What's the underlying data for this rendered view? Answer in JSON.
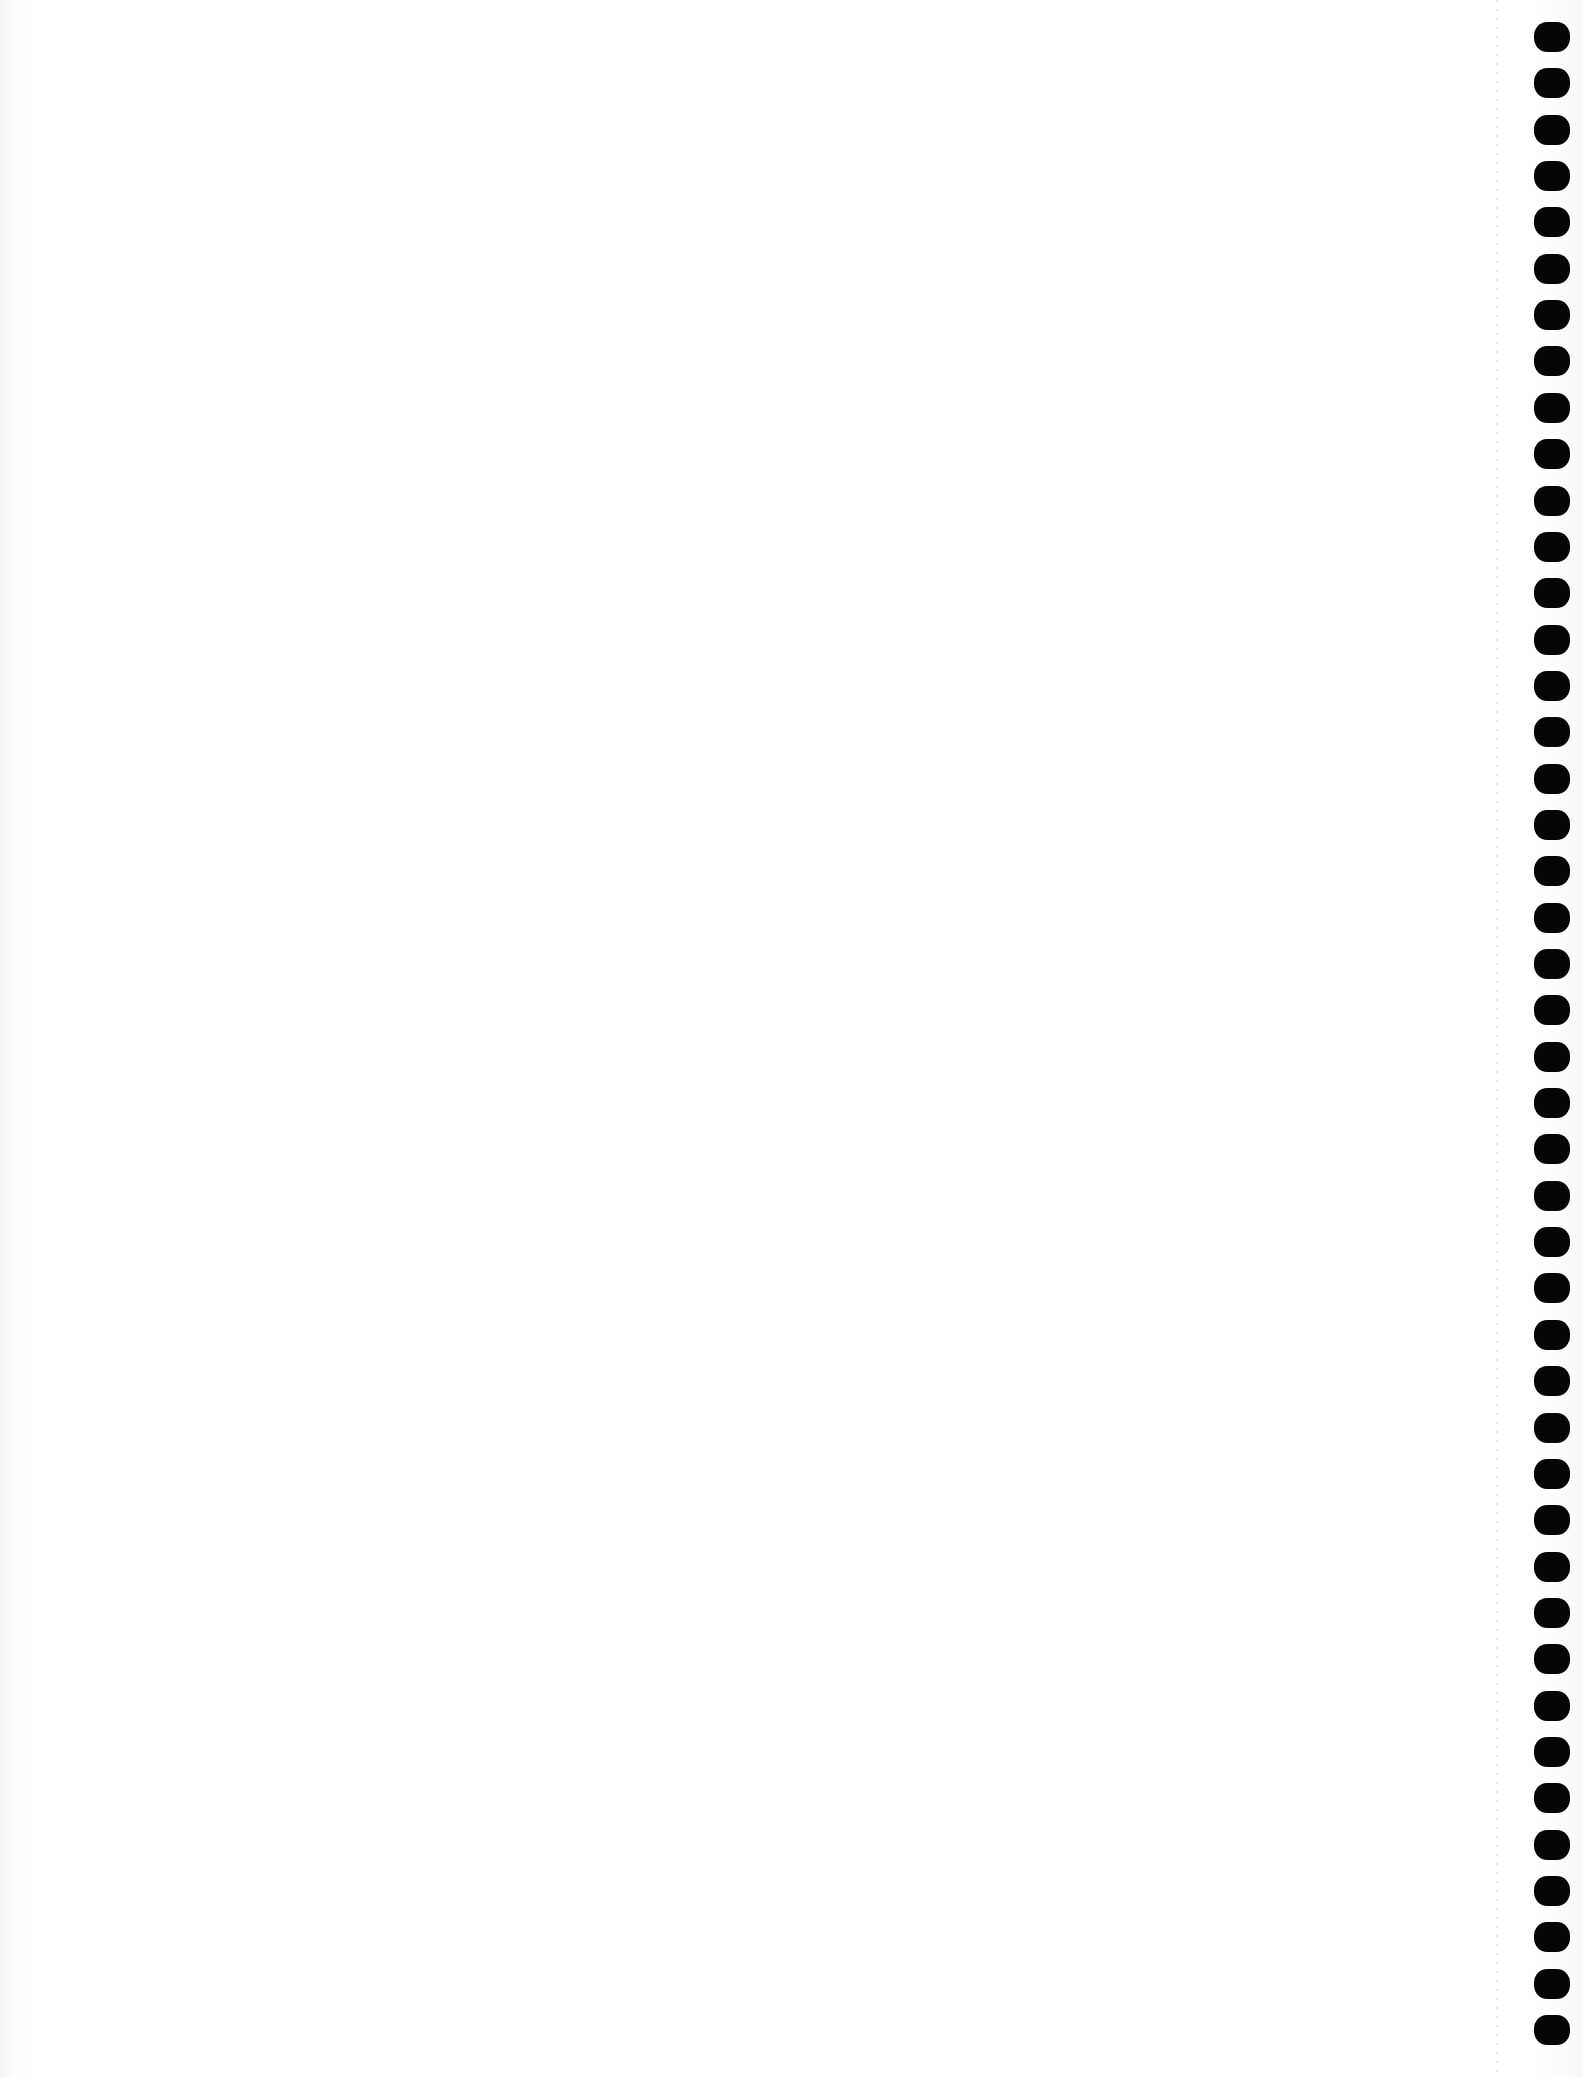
{
  "page": {
    "background": "#ffffff",
    "content_text": ""
  },
  "binding_holes": {
    "count": 44,
    "color": "#050505",
    "first_top": 22,
    "pitch": 46.35,
    "side": "right"
  }
}
